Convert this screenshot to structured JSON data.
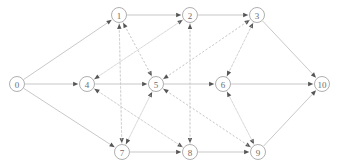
{
  "diagram": {
    "width": 339,
    "height": 168,
    "background_color": "#ffffff",
    "solid_edge_color": "#b0b0b0",
    "dashed_edge_color": "#c9c9c9",
    "node_stroke_color": "#9a9a9a",
    "node_fill_color": "#ffffff",
    "node_label_color": "#6e6e6e",
    "arrowhead_color": "#555555",
    "node_radius": 7.5,
    "nodes": [
      {
        "id": "0",
        "label": "0",
        "x": 17,
        "y": 84,
        "row": "middle"
      },
      {
        "id": "1",
        "label": "1",
        "x": 119,
        "y": 15,
        "row": "top"
      },
      {
        "id": "2",
        "label": "2",
        "x": 190,
        "y": 15,
        "row": "top"
      },
      {
        "id": "3",
        "label": "3",
        "x": 257,
        "y": 15,
        "row": "top"
      },
      {
        "id": "4",
        "label": "4",
        "x": 87,
        "y": 84,
        "row": "middle"
      },
      {
        "id": "5",
        "label": "5",
        "x": 156,
        "y": 84,
        "row": "middle"
      },
      {
        "id": "6",
        "label": "6",
        "x": 223,
        "y": 84,
        "row": "middle"
      },
      {
        "id": "7",
        "label": "7",
        "x": 122,
        "y": 152,
        "row": "bottom"
      },
      {
        "id": "8",
        "label": "8",
        "x": 190,
        "y": 152,
        "row": "bottom"
      },
      {
        "id": "9",
        "label": "9",
        "x": 258,
        "y": 152,
        "row": "bottom"
      },
      {
        "id": "10",
        "label": "10",
        "x": 322,
        "y": 84,
        "row": "middle"
      }
    ],
    "edges": [
      {
        "from": "0",
        "to": "1",
        "style": "solid"
      },
      {
        "from": "0",
        "to": "4",
        "style": "solid"
      },
      {
        "from": "0",
        "to": "7",
        "style": "solid"
      },
      {
        "from": "1",
        "to": "2",
        "style": "solid"
      },
      {
        "from": "2",
        "to": "3",
        "style": "solid"
      },
      {
        "from": "4",
        "to": "5",
        "style": "solid"
      },
      {
        "from": "5",
        "to": "6",
        "style": "solid"
      },
      {
        "from": "7",
        "to": "8",
        "style": "solid"
      },
      {
        "from": "8",
        "to": "9",
        "style": "solid"
      },
      {
        "from": "3",
        "to": "10",
        "style": "solid"
      },
      {
        "from": "6",
        "to": "10",
        "style": "solid"
      },
      {
        "from": "9",
        "to": "10",
        "style": "solid"
      },
      {
        "from": "1",
        "to": "5",
        "style": "dashed"
      },
      {
        "from": "5",
        "to": "1",
        "style": "dashed"
      },
      {
        "from": "4",
        "to": "2",
        "style": "dashed"
      },
      {
        "from": "2",
        "to": "4",
        "style": "dashed"
      },
      {
        "from": "2",
        "to": "8",
        "style": "dashed"
      },
      {
        "from": "8",
        "to": "2",
        "style": "dashed"
      },
      {
        "from": "1",
        "to": "7",
        "style": "dashed"
      },
      {
        "from": "7",
        "to": "1",
        "style": "dashed"
      },
      {
        "from": "4",
        "to": "8",
        "style": "dashed"
      },
      {
        "from": "8",
        "to": "4",
        "style": "dashed"
      },
      {
        "from": "5",
        "to": "9",
        "style": "dashed"
      },
      {
        "from": "9",
        "to": "5",
        "style": "dashed"
      },
      {
        "from": "6",
        "to": "3",
        "style": "dashed"
      },
      {
        "from": "3",
        "to": "6",
        "style": "dashed"
      },
      {
        "from": "5",
        "to": "3",
        "style": "dashed"
      },
      {
        "from": "3",
        "to": "5",
        "style": "dashed"
      },
      {
        "from": "6",
        "to": "9",
        "style": "dashed"
      },
      {
        "from": "9",
        "to": "6",
        "style": "dashed"
      },
      {
        "from": "7",
        "to": "5",
        "style": "dashed"
      },
      {
        "from": "5",
        "to": "7",
        "style": "dashed"
      }
    ]
  }
}
